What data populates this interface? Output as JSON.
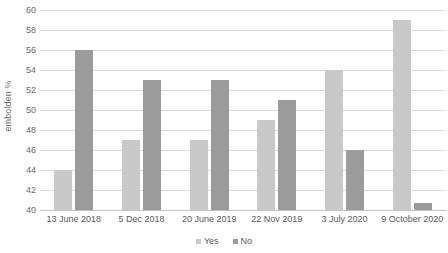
{
  "chart_data": {
    "type": "bar",
    "title": "",
    "subtitle": "",
    "xlabel": "",
    "ylabel": "embolden %",
    "categories": [
      "13 June 2018",
      "5 Dec 2018",
      "20 June 2019",
      "22 Nov 2019",
      "3 July 2020",
      "9 October 2020"
    ],
    "series": [
      {
        "name": "Yes",
        "color": "#c9c9c9",
        "values": [
          44,
          47,
          47,
          49,
          54,
          59
        ]
      },
      {
        "name": "No",
        "color": "#9b9b9b",
        "values": [
          56,
          53,
          53,
          51,
          46,
          40.7
        ]
      }
    ],
    "ylim": [
      40,
      60
    ],
    "ytick_step": 2,
    "ytick_labels": [
      "60",
      "58",
      "56",
      "54",
      "52",
      "50",
      "48",
      "46",
      "44",
      "42",
      "40"
    ],
    "ytick_values": [
      60,
      58,
      56,
      54,
      52,
      50,
      48,
      46,
      44,
      42,
      40
    ],
    "grid": true,
    "grid_axis": "y",
    "legend_position": "bottom",
    "background_color": "#ffffff",
    "grid_color": "#d9d9d9"
  }
}
